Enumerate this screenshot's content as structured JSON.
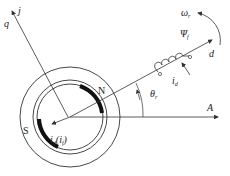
{
  "diagram": {
    "labels": {
      "q_axis": "q",
      "j_axis": "j",
      "d_axis": "d",
      "a_axis": "A",
      "north": "N",
      "south": "S",
      "omega": "ω",
      "omega_sub": "r",
      "psi": "Ψ",
      "psi_sub": "f",
      "i_d": "i",
      "i_d_sub": "d",
      "theta": "θ",
      "theta_sub": "r",
      "field_current": "i",
      "field_current_sub": "d",
      "field_current_paren": "(",
      "field_current_inner": "i",
      "field_current_inner_sub": "f",
      "field_current_close": ")"
    },
    "colors": {
      "line": "#333333",
      "pole": "#111111",
      "background": "#ffffff"
    }
  }
}
